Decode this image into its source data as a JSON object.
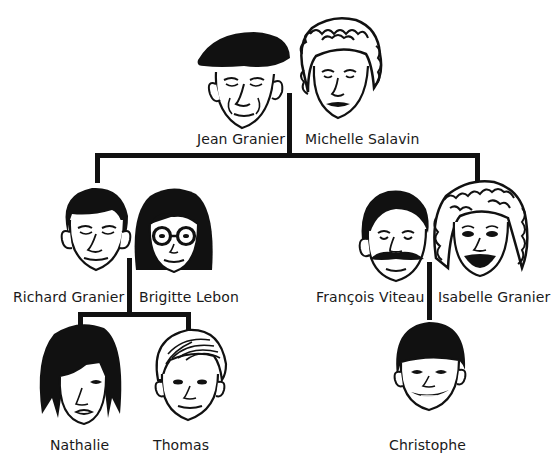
{
  "diagram": {
    "type": "family-tree",
    "line_color": "#111111",
    "generations": [
      {
        "level": 1,
        "couples": [
          {
            "id": "grandparents",
            "members": [
              {
                "name": "Jean Granier",
                "face": "elderly-man-beret"
              },
              {
                "name": "Michelle Salavin",
                "face": "elderly-woman-curly-hair"
              }
            ]
          }
        ]
      },
      {
        "level": 2,
        "couples": [
          {
            "id": "left-couple",
            "members": [
              {
                "name": "Richard Granier",
                "face": "man-dark-hair"
              },
              {
                "name": "Brigitte Lebon",
                "face": "woman-bob-glasses"
              }
            ]
          },
          {
            "id": "right-couple",
            "members": [
              {
                "name": "François Viteau",
                "face": "man-mustache"
              },
              {
                "name": "Isabelle Granier",
                "face": "woman-curly-hair"
              }
            ]
          }
        ]
      },
      {
        "level": 3,
        "children": [
          {
            "name": "Nathalie",
            "face": "girl-dark-hair",
            "parents": "left-couple"
          },
          {
            "name": "Thomas",
            "face": "boy-light-hair",
            "parents": "left-couple"
          },
          {
            "name": "Christophe",
            "face": "boy-bowl-cut",
            "parents": "right-couple"
          }
        ]
      }
    ]
  },
  "labels": {
    "jean": "Jean Granier",
    "michelle": "Michelle Salavin",
    "richard": "Richard Granier",
    "brigitte": "Brigitte Lebon",
    "francois": "François Viteau",
    "isabelle": "Isabelle Granier",
    "nathalie": "Nathalie",
    "thomas": "Thomas",
    "christophe": "Christophe"
  }
}
